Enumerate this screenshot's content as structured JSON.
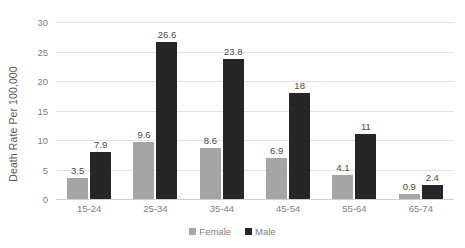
{
  "chart_data": {
    "type": "bar",
    "title": "",
    "xlabel": "",
    "ylabel": "Death Rate Per 100,000",
    "ylim": [
      0,
      30
    ],
    "yticks": [
      0,
      5,
      10,
      15,
      20,
      25,
      30
    ],
    "ytick_labels": [
      "0",
      "5",
      "10",
      "15",
      "20",
      "25",
      "30"
    ],
    "grid": true,
    "legend_position": "bottom",
    "categories": [
      "15-24",
      "25-34",
      "35-44",
      "45-54",
      "55-64",
      "65-74"
    ],
    "series": [
      {
        "name": "Female",
        "color": "#a5a5a5",
        "values": [
          3.5,
          9.6,
          8.6,
          6.9,
          4.1,
          0.9
        ],
        "labels": [
          "3.5",
          "9.6",
          "8.6",
          "6.9",
          "4.1",
          "0.9"
        ]
      },
      {
        "name": "Male",
        "color": "#262626",
        "values": [
          7.9,
          26.6,
          23.8,
          18,
          11,
          2.4
        ],
        "labels": [
          "7.9",
          "26.6",
          "23.8",
          "18",
          "11",
          "2.4"
        ]
      }
    ]
  },
  "legend": {
    "items": [
      {
        "label": "Female",
        "color": "#a5a5a5"
      },
      {
        "label": "Male",
        "color": "#262626"
      }
    ]
  }
}
